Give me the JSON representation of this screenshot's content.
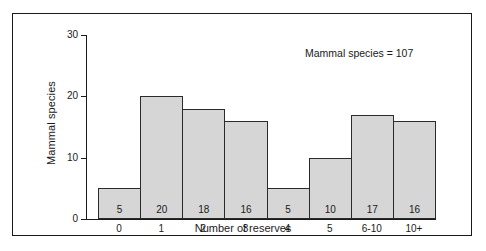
{
  "chart_data": {
    "type": "bar",
    "title": "",
    "annotation": "Mammal species = 107",
    "xlabel": "Number of reserves",
    "ylabel": "Mammal species",
    "categories": [
      "0",
      "1",
      "2",
      "3",
      "4",
      "5",
      "6-10",
      "10+"
    ],
    "values": [
      5,
      20,
      18,
      16,
      5,
      10,
      17,
      16
    ],
    "value_labels": [
      "5",
      "20",
      "18",
      "16",
      "5",
      "10",
      "17",
      "16"
    ],
    "ylim": [
      0,
      30
    ],
    "yticks": [
      0,
      10,
      20,
      30
    ],
    "ytick_labels": [
      "0",
      "10",
      "20",
      "30"
    ],
    "grid": false,
    "legend": false,
    "bars_contiguous": true,
    "colors": {
      "bar_fill": "#d6d6d6",
      "bar_stroke": "#2b2b2b",
      "axis": "#1a1a1a",
      "text": "#1a1a1a",
      "frame": "#1a1a1a",
      "background": "#ffffff"
    }
  }
}
